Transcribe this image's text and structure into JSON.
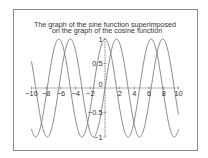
{
  "chart_data": {
    "type": "line",
    "title": "The graph of the sine function superimposed on the graph of the cosine function",
    "title_lines": [
      "The graph of the sine function superimposed",
      "on the graph of the cosine function"
    ],
    "xlabel": "",
    "ylabel": "",
    "xlim": [
      -10,
      10
    ],
    "ylim": [
      -1,
      1
    ],
    "x_ticks": [
      "-10",
      "-8",
      "-6",
      "-4",
      "-2",
      "0",
      "2",
      "4",
      "6",
      "8",
      "10"
    ],
    "y_ticks": [
      "1",
      "0.5",
      "0",
      "-0.5",
      "-1"
    ],
    "grid": false,
    "legend": null,
    "series": [
      {
        "name": "sin(x)",
        "function": "sin",
        "color": "#7a7a7a"
      },
      {
        "name": "cos(x)",
        "function": "cos",
        "color": "#7a7a7a"
      }
    ]
  },
  "style": {
    "curve_color": "#7a7a7a",
    "axis_color": "#666666",
    "frame_color": "#8a8a8a"
  }
}
